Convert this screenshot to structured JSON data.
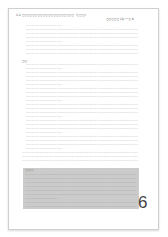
{
  "document": {
    "title": "1.2 ○○○○○○○○○○○○○○○○○○○○（○○○）",
    "ref": "○○○○○ (1) 一○ 4",
    "placeholder_line": "○○○○○○○○○○○○○○○○○○○○○○○○○○○○○○○○○○○○○○○○○○○○○○○○○○○○○○○○○○○○",
    "short_line": "○○○○○○○○○○○○○○○○○",
    "heading2": "○○",
    "box_label": "○○○○",
    "page_number": "6"
  }
}
